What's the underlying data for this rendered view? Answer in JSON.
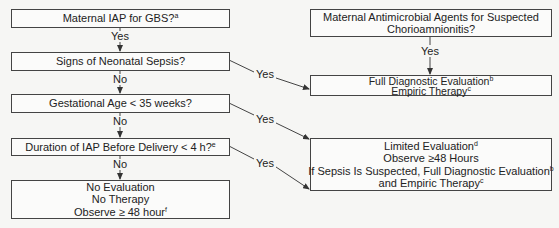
{
  "left_column": {
    "maternal_iap": {
      "text": "Maternal IAP for GBS?",
      "sup": "a"
    },
    "yes_1": "Yes",
    "signs_sepsis": {
      "text": "Signs of Neonatal Sepsis?"
    },
    "no_1": "No",
    "gest_age": {
      "text": "Gestational Age < 35 weeks?"
    },
    "no_2": "No",
    "duration_iap": {
      "text": "Duration of IAP Before Delivery < 4 h?",
      "sup": "e"
    },
    "no_3": "No",
    "no_eval": {
      "line1": "No Evaluation",
      "line2": "No Therapy",
      "line3": "Observe ≥ 48 hour",
      "line3_sup": "f"
    }
  },
  "right_column": {
    "maternal_antimicrobial": {
      "line1": "Maternal Antimicrobial Agents for Suspected",
      "line2": "Chorioamnionitis?"
    },
    "yes_top": "Yes",
    "full_eval": {
      "line1": "Full Diagnostic Evaluation",
      "line1_sup": "b",
      "line2": "Empiric Therapy",
      "line2_sup": "c"
    },
    "limited_eval": {
      "line1": "Limited Evaluation",
      "line1_sup": "d",
      "line2": "Observe ≥48 Hours",
      "line3": "If Sepsis Is Suspected, Full Diagnostic Evaluation",
      "line3_sup": "b",
      "line4": "and Empiric Therapy",
      "line4_sup": "c"
    }
  },
  "connectors": {
    "yes_sepsis": "Yes",
    "yes_gest": "Yes",
    "yes_duration": "Yes"
  },
  "colors": {
    "line": "#444444",
    "background": "#f6f6f4"
  }
}
